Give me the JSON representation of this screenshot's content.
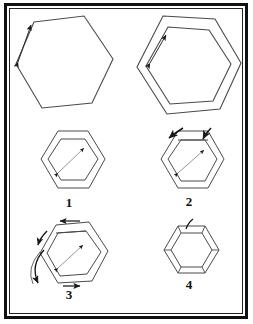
{
  "figure": {
    "background_color": "#ffffff",
    "line_color": "#3a3a3a",
    "frame_color": "#111111",
    "panel_count": 6
  },
  "captions": {
    "step_1": "1",
    "step_2": "2",
    "step_3": "3",
    "step_4": "4"
  },
  "panels": [
    {
      "id": "top-left",
      "name": "single-hexagon-with-edge-arrow",
      "shape": "hexagon",
      "rings": 1,
      "annotations": [
        "double-headed-arrow-on-upper-left-edge"
      ],
      "caption": ""
    },
    {
      "id": "top-right",
      "name": "double-hexagon-with-edge-arrow",
      "shape": "hexagon",
      "rings": 2,
      "annotations": [
        "double-headed-arrow-on-inner-upper-left-edge"
      ],
      "caption": ""
    },
    {
      "id": "step-1",
      "name": "double-hexagon-flat",
      "shape": "hexagon",
      "rings": 2,
      "annotations": [
        "diagonal-double-arrow-inside"
      ],
      "caption": "1"
    },
    {
      "id": "step-2",
      "name": "double-hexagon-folding-top",
      "shape": "hexagon",
      "rings": 2,
      "annotations": [
        "curved-fold-arrow-left",
        "curved-fold-arrow-right",
        "diagonal-double-arrow-inside"
      ],
      "caption": "2"
    },
    {
      "id": "step-3",
      "name": "double-hexagon-folding-side",
      "shape": "hexagon",
      "rings": 2,
      "annotations": [
        "straight-arrow-top-left",
        "straight-arrow-bottom-right",
        "curved-fold-arrows-left-side",
        "diagonal-double-arrow-inside"
      ],
      "caption": "3"
    },
    {
      "id": "step-4",
      "name": "completed-double-hexagon",
      "shape": "hexagon",
      "rings": 2,
      "annotations": [
        "vertex-tick-marks",
        "curved-arrow-top"
      ],
      "caption": "4"
    }
  ]
}
